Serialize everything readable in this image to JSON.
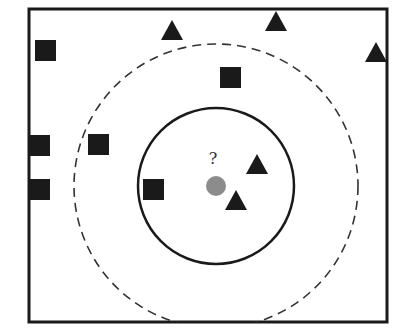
{
  "diagram": {
    "type": "knn-illustration",
    "query_label": "?",
    "colors": {
      "background": "#ffffff",
      "stroke": "#1a1a1a",
      "marker": "#1a1a1a",
      "query_point": "#8c8c8c"
    },
    "frame": {
      "x": 29,
      "y": 9,
      "width": 358,
      "height": 313
    },
    "circles": [
      {
        "name": "inner-circle-k3",
        "cx": 216,
        "cy": 186,
        "r": 78,
        "style": "solid"
      },
      {
        "name": "outer-circle-k5",
        "cx": 216,
        "cy": 186,
        "r": 142,
        "style": "dashed"
      }
    ],
    "query_point": {
      "cx": 216,
      "cy": 186,
      "r": 10
    },
    "squares": [
      {
        "x": 45,
        "y": 50
      },
      {
        "x": 230,
        "y": 77
      },
      {
        "x": 39,
        "y": 145
      },
      {
        "x": 98,
        "y": 144
      },
      {
        "x": 39,
        "y": 189
      },
      {
        "x": 153,
        "y": 189
      }
    ],
    "triangles": [
      {
        "x": 172,
        "y": 30
      },
      {
        "x": 276,
        "y": 21
      },
      {
        "x": 376,
        "y": 52
      },
      {
        "x": 257,
        "y": 164
      },
      {
        "x": 236,
        "y": 200
      }
    ]
  }
}
